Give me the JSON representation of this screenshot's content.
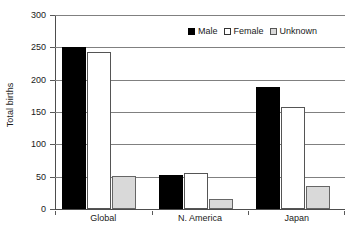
{
  "chart_data": {
    "type": "bar",
    "title": "",
    "subtitle": "",
    "xlabel": "",
    "ylabel": "Total births",
    "categories": [
      "Global",
      "N. America",
      "Japan"
    ],
    "series": [
      {
        "name": "Male",
        "values": [
          250,
          53,
          188
        ],
        "color": "#000000"
      },
      {
        "name": "Female",
        "values": [
          243,
          55,
          158
        ],
        "color": "#ffffff"
      },
      {
        "name": "Unknown",
        "values": [
          51,
          15,
          35
        ],
        "color": "#d9d9d9"
      }
    ],
    "ylim": [
      0,
      300
    ],
    "yticks": [
      0,
      50,
      100,
      150,
      200,
      250,
      300
    ],
    "ytick_labels": [
      "0",
      "50",
      "100",
      "150",
      "200",
      "250",
      "300"
    ],
    "grid": true,
    "grid_axis": "y",
    "legend_position": "top-right",
    "legend_orientation": "horizontal"
  },
  "axes": {
    "y_title": "Total births"
  }
}
